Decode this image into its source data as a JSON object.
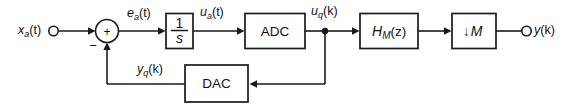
{
  "diagram": {
    "type": "signal-flow-block-diagram",
    "background_color": "#ffffff",
    "line_color": "#1a1a1a",
    "terminals": {
      "input": {
        "label_main": "x",
        "label_sub": "a",
        "label_tail": "(t)",
        "full_text": "x_a(t)"
      },
      "output": {
        "label_main": "y",
        "label_tail": "(k)",
        "full_text": "y(k)"
      }
    },
    "summing_junction": {
      "name": "summer",
      "plus_sign": "+",
      "minus_sign": "−"
    },
    "blocks": [
      {
        "id": "integrator",
        "kind": "fraction",
        "numerator": "1",
        "denominator": "s",
        "full_text": "1/s"
      },
      {
        "id": "adc",
        "kind": "text",
        "label": "ADC"
      },
      {
        "id": "filter",
        "kind": "subscripted",
        "label_main": "H",
        "label_sub": "M",
        "label_tail": "(z)",
        "full_text": "H_M(z)"
      },
      {
        "id": "decimator",
        "kind": "text",
        "label_arrow": "↓",
        "label_main": "M",
        "full_text": "↓M"
      },
      {
        "id": "dac",
        "kind": "text",
        "label": "DAC"
      }
    ],
    "signal_labels": [
      {
        "id": "e_a_t",
        "main": "e",
        "sub": "a",
        "tail": "(t)",
        "full_text": "e_a(t)"
      },
      {
        "id": "u_a_t",
        "main": "u",
        "sub": "a",
        "tail": "(t)",
        "full_text": "u_a(t)"
      },
      {
        "id": "u_q_k",
        "main": "u",
        "sub": "q",
        "tail": "(k)",
        "full_text": "u_q(k)"
      },
      {
        "id": "y_q_k",
        "main": "y",
        "sub": "q",
        "tail": "(k)",
        "full_text": "y_q(k)"
      }
    ]
  }
}
